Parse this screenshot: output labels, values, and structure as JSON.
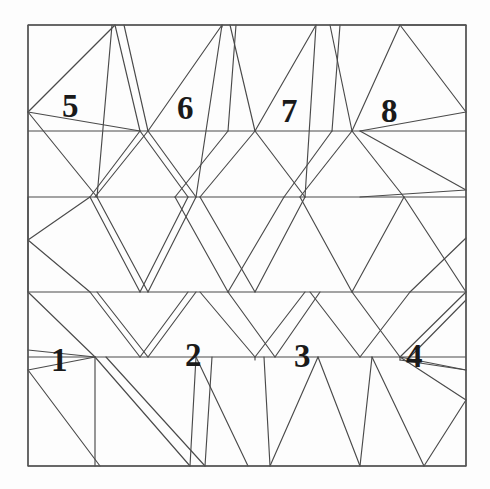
{
  "figure": {
    "kind": "geometric-line-diagram",
    "background_color": "#fdfdfd",
    "line_color": "#4a4a4a",
    "border_color": "#555555",
    "label_color": "#1a1a1a",
    "canvas": {
      "width": 490,
      "height": 489
    },
    "frame": {
      "x0": 28,
      "y0": 25,
      "x1": 466,
      "y1": 466
    }
  },
  "labels": [
    {
      "id": "label-1",
      "text": "1",
      "x": 51,
      "y": 344,
      "weight": "bold"
    },
    {
      "id": "label-2",
      "text": "2",
      "x": 185,
      "y": 339,
      "weight": "bold"
    },
    {
      "id": "label-3",
      "text": "3",
      "x": 294,
      "y": 340,
      "weight": "bold"
    },
    {
      "id": "label-4",
      "text": "4",
      "x": 406,
      "y": 340,
      "weight": "bold"
    },
    {
      "id": "label-5",
      "text": "5",
      "x": 62,
      "y": 90,
      "weight": "bold"
    },
    {
      "id": "label-6",
      "text": "6",
      "x": 177,
      "y": 92,
      "weight": "bold"
    },
    {
      "id": "label-7",
      "text": "7",
      "x": 281,
      "y": 95,
      "weight": "normal"
    },
    {
      "id": "label-8",
      "text": "8",
      "x": 381,
      "y": 95,
      "weight": "normal"
    }
  ],
  "geometry": {
    "note": "All coordinates are in the 490x489 canvas space.",
    "border": [
      [
        28,
        25,
        466,
        25
      ],
      [
        466,
        25,
        466,
        466
      ],
      [
        466,
        466,
        28,
        466
      ],
      [
        28,
        466,
        28,
        25
      ]
    ],
    "horizontal_rails": [
      {
        "name": "rail-top",
        "y": 131,
        "x_from": 28,
        "x_to": 466
      },
      {
        "name": "rail-upper-mid",
        "y": 197,
        "x_from": 28,
        "x_to": 466
      },
      {
        "name": "rail-lower-mid",
        "y": 292,
        "x_from": 28,
        "x_to": 466
      },
      {
        "name": "rail-bottom",
        "y": 357,
        "x_from": 28,
        "x_to": 466
      }
    ],
    "lattice_lines": [
      [
        28,
        25,
        28,
        466
      ],
      [
        466,
        25,
        466,
        466
      ],
      [
        28,
        25,
        466,
        25
      ],
      [
        28,
        466,
        466,
        466
      ],
      [
        28,
        112,
        115,
        25
      ],
      [
        28,
        112,
        140,
        131
      ],
      [
        28,
        112,
        97,
        197
      ],
      [
        115,
        25,
        140,
        131
      ],
      [
        112,
        25,
        97,
        197
      ],
      [
        124,
        25,
        148,
        131
      ],
      [
        148,
        131,
        222,
        25
      ],
      [
        222,
        25,
        222,
        27
      ],
      [
        148,
        131,
        95,
        197
      ],
      [
        148,
        131,
        196,
        197
      ],
      [
        196,
        197,
        222,
        25
      ],
      [
        140,
        131,
        90,
        197
      ],
      [
        140,
        131,
        188,
        197
      ],
      [
        230,
        25,
        255,
        131
      ],
      [
        255,
        131,
        316,
        25
      ],
      [
        255,
        131,
        200,
        197
      ],
      [
        255,
        131,
        305,
        197
      ],
      [
        305,
        197,
        316,
        25
      ],
      [
        236,
        25,
        228,
        131
      ],
      [
        228,
        131,
        175,
        197
      ],
      [
        330,
        25,
        352,
        131
      ],
      [
        352,
        131,
        400,
        25
      ],
      [
        352,
        131,
        300,
        197
      ],
      [
        352,
        131,
        404,
        197
      ],
      [
        340,
        25,
        332,
        131
      ],
      [
        332,
        131,
        284,
        197
      ],
      [
        400,
        25,
        466,
        25
      ],
      [
        400,
        25,
        466,
        112
      ],
      [
        466,
        112,
        360,
        131
      ],
      [
        360,
        131,
        466,
        190
      ],
      [
        466,
        190,
        360,
        197
      ],
      [
        97,
        197,
        148,
        292
      ],
      [
        148,
        292,
        196,
        197
      ],
      [
        90,
        197,
        140,
        292
      ],
      [
        140,
        292,
        188,
        197
      ],
      [
        200,
        197,
        255,
        292
      ],
      [
        255,
        292,
        305,
        197
      ],
      [
        175,
        197,
        228,
        292
      ],
      [
        228,
        292,
        284,
        197
      ],
      [
        300,
        197,
        352,
        292
      ],
      [
        352,
        292,
        404,
        197
      ],
      [
        404,
        197,
        466,
        292
      ],
      [
        466,
        238,
        410,
        292
      ],
      [
        28,
        197,
        28,
        292
      ],
      [
        28,
        240,
        90,
        197
      ],
      [
        28,
        240,
        90,
        292
      ],
      [
        97,
        292,
        148,
        357
      ],
      [
        148,
        357,
        196,
        292
      ],
      [
        90,
        292,
        140,
        357
      ],
      [
        140,
        357,
        188,
        292
      ],
      [
        200,
        292,
        255,
        357
      ],
      [
        255,
        357,
        305,
        292
      ],
      [
        228,
        292,
        275,
        357
      ],
      [
        275,
        357,
        320,
        292
      ],
      [
        310,
        292,
        360,
        357
      ],
      [
        360,
        357,
        410,
        292
      ],
      [
        352,
        292,
        400,
        357
      ],
      [
        28,
        292,
        95,
        357
      ],
      [
        28,
        350,
        95,
        357
      ],
      [
        95,
        357,
        28,
        370
      ],
      [
        400,
        357,
        466,
        292
      ],
      [
        400,
        357,
        466,
        370
      ],
      [
        466,
        300,
        410,
        357
      ],
      [
        95,
        357,
        95,
        466
      ],
      [
        95,
        357,
        190,
        466
      ],
      [
        106,
        357,
        205,
        466
      ],
      [
        28,
        370,
        100,
        466
      ],
      [
        190,
        466,
        196,
        357
      ],
      [
        196,
        357,
        248,
        466
      ],
      [
        205,
        466,
        212,
        357
      ],
      [
        255,
        357,
        255,
        360
      ],
      [
        264,
        357,
        270,
        466
      ],
      [
        270,
        466,
        318,
        357
      ],
      [
        318,
        357,
        360,
        466
      ],
      [
        360,
        466,
        372,
        357
      ],
      [
        400,
        357,
        400,
        360
      ],
      [
        372,
        357,
        424,
        466
      ],
      [
        400,
        357,
        466,
        400
      ],
      [
        466,
        400,
        424,
        466
      ],
      [
        466,
        370,
        400,
        360
      ]
    ]
  }
}
